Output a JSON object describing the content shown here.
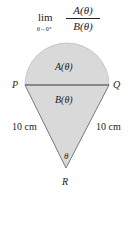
{
  "formula": {
    "lim": "lim",
    "limit_sub": "θ→0⁺",
    "numerator": "A(θ)",
    "denominator": "B(θ)"
  },
  "diagram": {
    "points": {
      "P": "P",
      "Q": "Q",
      "R": "R"
    },
    "region_a_label": "A(θ)",
    "region_b_label": "B(θ)",
    "angle_label": "θ",
    "side_left_label": "10 cm",
    "side_right_label": "10 cm",
    "colors": {
      "fill": "#d9d9d9",
      "stroke": "#7a7a7a"
    }
  }
}
